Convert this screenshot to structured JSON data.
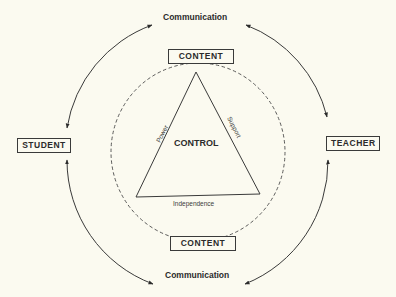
{
  "diagram": {
    "type": "relationship-diagram",
    "nodes": {
      "student": "STUDENT",
      "teacher": "TEACHER",
      "content_top": "CONTENT",
      "content_bottom": "CONTENT",
      "control": "CONTROL"
    },
    "triangle_sides": {
      "left": "Power",
      "right": "Support",
      "bottom": "Independence"
    },
    "communication_top": "Communication",
    "communication_bottom": "Communication",
    "edges": [
      {
        "from": "STUDENT",
        "to": "Communication (top)",
        "style": "bidirectional-arc"
      },
      {
        "from": "Communication (top)",
        "to": "TEACHER",
        "style": "bidirectional-arc"
      },
      {
        "from": "STUDENT",
        "to": "Communication (bottom)",
        "style": "bidirectional-arc"
      },
      {
        "from": "Communication (bottom)",
        "to": "TEACHER",
        "style": "bidirectional-arc"
      }
    ],
    "inner_boundary": "dashed-circle",
    "colors": {
      "background": "#fbfaf0",
      "ink": "#2b2b2b"
    }
  }
}
